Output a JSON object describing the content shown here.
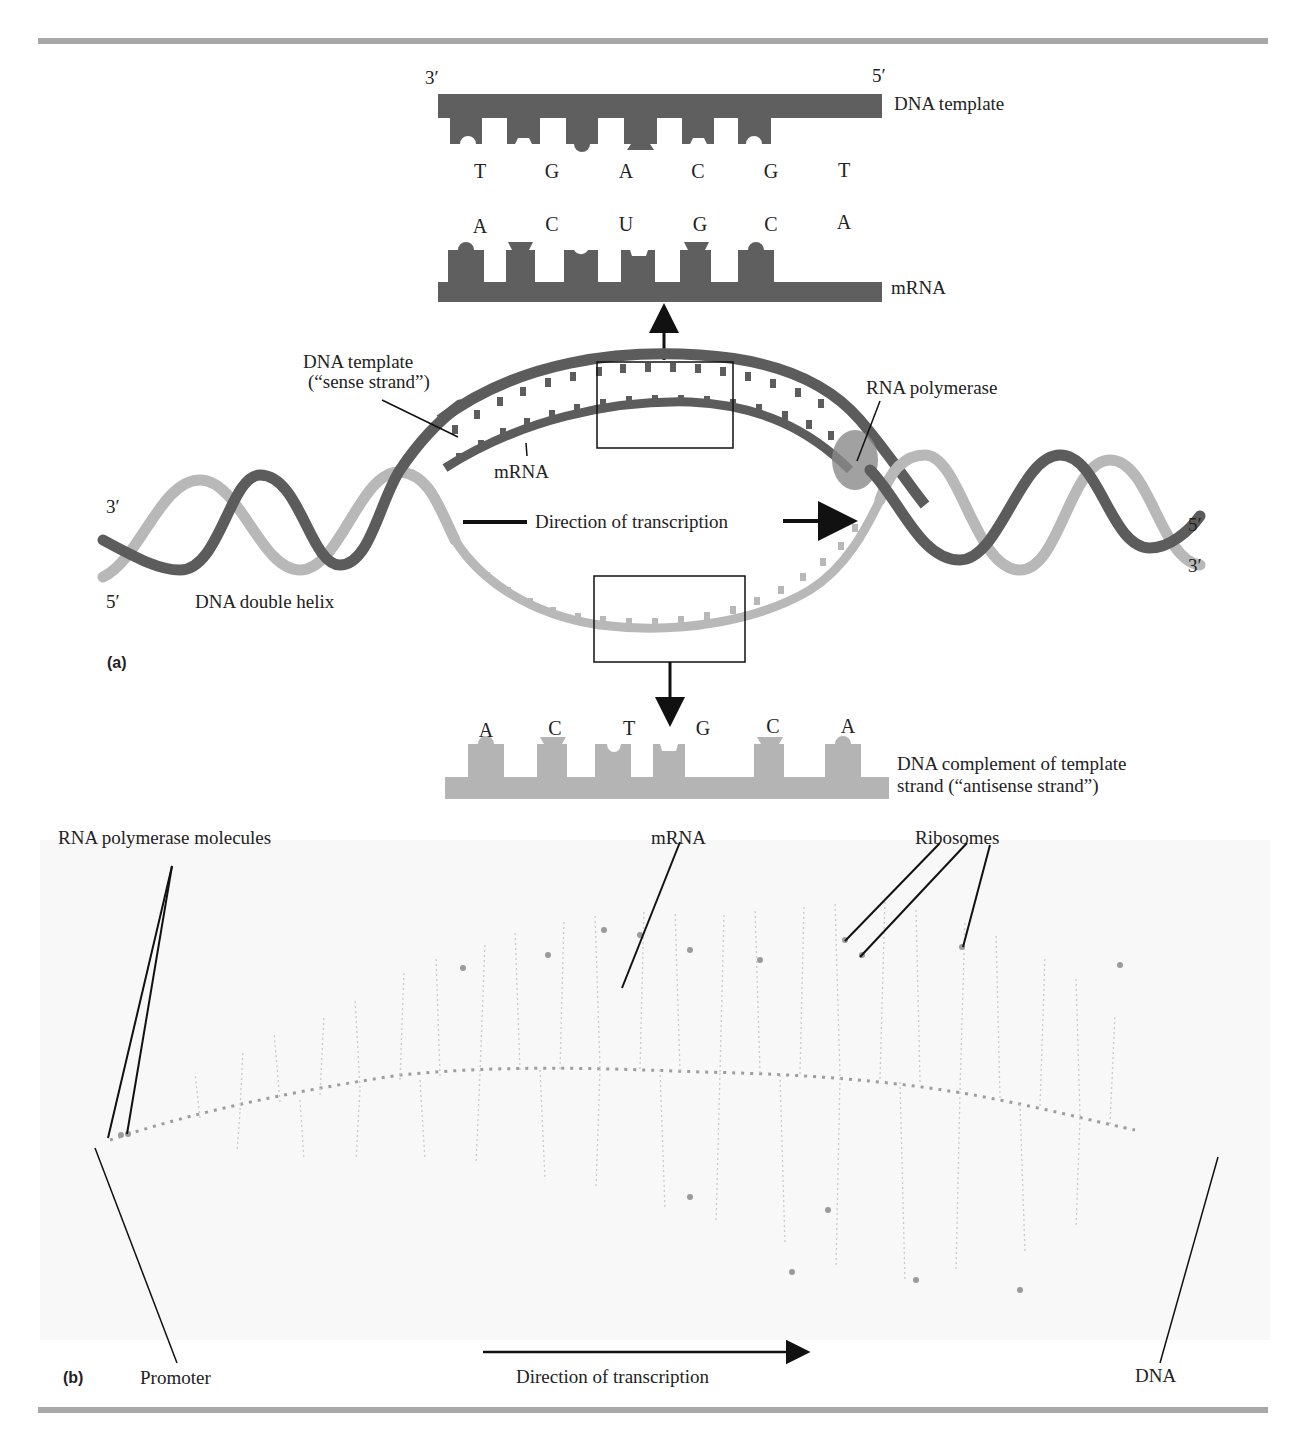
{
  "figure": {
    "panel_a": {
      "tag": "(a)",
      "top_strand": {
        "end_left": "3′",
        "end_right": "5′",
        "label": "DNA template",
        "bases": [
          "T",
          "G",
          "A",
          "C",
          "G",
          "T"
        ],
        "color": "#5f5f5f"
      },
      "mrna_strand": {
        "label": "mRNA",
        "bases": [
          "A",
          "C",
          "U",
          "G",
          "C",
          "A"
        ],
        "color": "#5f5f5f"
      },
      "bubble_labels": {
        "template_line1": "DNA template",
        "template_line2": "(“sense strand”)",
        "mrna": "mRNA",
        "polymerase": "RNA polymerase",
        "direction": "Direction of transcription",
        "helix": "DNA double helix",
        "left_top_end": "3′",
        "left_bottom_end": "5′",
        "right_top_end": "5′",
        "right_bottom_end": "3′"
      },
      "bottom_strand": {
        "label_line1": "DNA complement of template",
        "label_line2": "strand (“antisense strand”)",
        "bases": [
          "A",
          "C",
          "T",
          "G",
          "C",
          "A"
        ],
        "color": "#b4b4b4"
      },
      "colors": {
        "dark_strand": "#5c5c5c",
        "light_strand": "#b8b8b8",
        "polymerase": "#8a8a8a"
      }
    },
    "panel_b": {
      "tag": "(b)",
      "labels": {
        "polymerase_molecules": "RNA polymerase molecules",
        "mrna": "mRNA",
        "ribosomes": "Ribosomes",
        "promoter": "Promoter",
        "direction": "Direction of transcription",
        "dna": "DNA"
      },
      "image_description": "Electron micrograph of transcription and translation: DNA axis with mRNA strands and ribosomes"
    },
    "caption_fragment": "Figure ... transcription ... DNA double helix ..."
  }
}
